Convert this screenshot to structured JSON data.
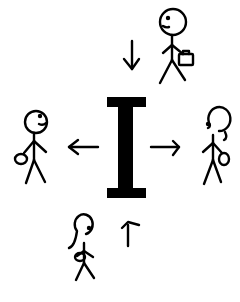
{
  "illustration": {
    "description": "Stick figures around a central capital letter I with arrows",
    "central_glyph": "I",
    "colors": {
      "ink": "#000000",
      "background": "#ffffff"
    },
    "arrows": [
      {
        "direction": "down",
        "position": "top"
      },
      {
        "direction": "left",
        "position": "left"
      },
      {
        "direction": "right",
        "position": "right"
      },
      {
        "direction": "up",
        "position": "bottom"
      }
    ],
    "figures": [
      {
        "id": "top-right",
        "kind": "stick-figure-with-briefcase"
      },
      {
        "id": "left",
        "kind": "stick-figure-with-bag"
      },
      {
        "id": "right",
        "kind": "stick-figure-female-with-bag"
      },
      {
        "id": "bottom",
        "kind": "stick-figure-female-with-bag"
      }
    ]
  }
}
